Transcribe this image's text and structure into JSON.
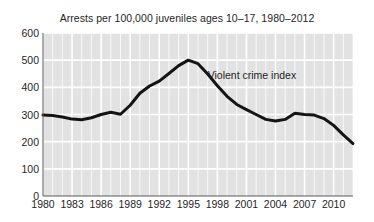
{
  "chart_data": {
    "type": "line",
    "title": "Arrests per 100,000 juveniles ages 10–17, 1980–2012",
    "xlabel": "",
    "ylabel": "",
    "xlim": [
      1980,
      2012
    ],
    "ylim": [
      0,
      600
    ],
    "y_ticks": [
      0,
      100,
      200,
      300,
      400,
      500,
      600
    ],
    "y_tick_labels": [
      "0",
      "100",
      "200",
      "300",
      "400",
      "500",
      "600"
    ],
    "x_ticks": [
      1980,
      1983,
      1986,
      1989,
      1992,
      1995,
      1998,
      2001,
      2004,
      2007,
      2010
    ],
    "x_tick_labels": [
      "1980",
      "1983",
      "1986",
      "1989",
      "1992",
      "1995",
      "1998",
      "2001",
      "2004",
      "2007",
      "2010"
    ],
    "grid": true,
    "grid_color": "#ffffff",
    "plot_background": "#e2e2e2",
    "legend": "none",
    "annotations": [
      {
        "text": "Violent crime index",
        "x": 1997,
        "y": 440
      }
    ],
    "series": [
      {
        "name": "Violent crime index",
        "color": "#141414",
        "line_width": 3,
        "x": [
          1980,
          1981,
          1982,
          1983,
          1984,
          1985,
          1986,
          1987,
          1988,
          1989,
          1990,
          1991,
          1992,
          1993,
          1994,
          1995,
          1996,
          1997,
          1998,
          1999,
          2000,
          2001,
          2002,
          2003,
          2004,
          2005,
          2006,
          2007,
          2008,
          2009,
          2010,
          2011,
          2012
        ],
        "values": [
          298,
          296,
          291,
          283,
          281,
          288,
          300,
          308,
          301,
          334,
          378,
          405,
          423,
          451,
          480,
          500,
          487,
          449,
          406,
          367,
          337,
          318,
          300,
          282,
          276,
          282,
          305,
          300,
          298,
          285,
          260,
          225,
          193
        ]
      }
    ]
  }
}
